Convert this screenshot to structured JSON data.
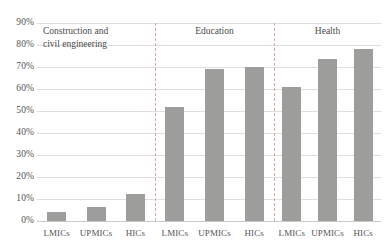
{
  "chart_data": {
    "type": "bar",
    "title": "",
    "subtitle": "",
    "xlabel": "",
    "ylabel": "",
    "ylim": [
      0,
      90
    ],
    "ytick_labels": [
      "90%",
      "80%",
      "70%",
      "60%",
      "50%",
      "40%",
      "30%",
      "20%",
      "10%",
      "0%"
    ],
    "ytick_values": [
      90,
      80,
      70,
      60,
      50,
      40,
      30,
      20,
      10,
      0
    ],
    "ytick_format": "percent",
    "grid": true,
    "legend": "none",
    "group_separators": true,
    "bar_color": "#9d9d9b",
    "gridline_color": "#dededc",
    "separator_color": "#d8a7a7",
    "categories": [
      "LMICs",
      "UPMICs",
      "HICs"
    ],
    "groups": [
      {
        "name": "Construction and civil engineering",
        "name_line1": "Construction and",
        "name_line2": "civil engineering",
        "bars": [
          {
            "label": "LMICs",
            "value": 4
          },
          {
            "label": "UPMICs",
            "value": 6.5
          },
          {
            "label": "HICs",
            "value": 12.5
          }
        ]
      },
      {
        "name": "Education",
        "bars": [
          {
            "label": "LMICs",
            "value": 52
          },
          {
            "label": "UPMICs",
            "value": 69
          },
          {
            "label": "HICs",
            "value": 70
          }
        ]
      },
      {
        "name": "Health",
        "bars": [
          {
            "label": "LMICs",
            "value": 61
          },
          {
            "label": "UPMICs",
            "value": 73.5
          },
          {
            "label": "HICs",
            "value": 78
          }
        ]
      }
    ],
    "series": [
      {
        "name": "LMICs",
        "values": [
          4,
          52,
          61
        ]
      },
      {
        "name": "UPMICs",
        "values": [
          6.5,
          69,
          73.5
        ]
      },
      {
        "name": "HICs",
        "values": [
          12.5,
          70,
          78
        ]
      }
    ],
    "x": [
      "Construction and civil engineering",
      "Education",
      "Health"
    ]
  }
}
